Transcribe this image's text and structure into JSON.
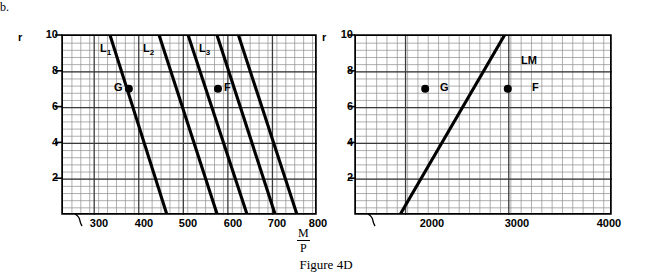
{
  "figure": {
    "panel_letter": "b.",
    "caption": "Figure 4D"
  },
  "chart_data": [
    {
      "id": "left",
      "type": "line",
      "title": "",
      "xlabel": "M/P",
      "ylabel": "r",
      "xlim": [
        230,
        800
      ],
      "ylim": [
        0,
        10
      ],
      "xticks": [
        300,
        400,
        500,
        600,
        700,
        800
      ],
      "yticks": [
        2,
        4,
        6,
        8,
        10
      ],
      "grid": true,
      "grid_minor_step_x": 20,
      "grid_minor_step_y": 0.4,
      "axis_break_x": true,
      "series": [
        {
          "name": "L1",
          "label": "L₁",
          "label_text": "L",
          "label_sub": "1",
          "points": [
            [
              330,
              10.6
            ],
            [
              465,
              0
            ]
          ]
        },
        {
          "name": "L2",
          "label": "L₂",
          "label_text": "L",
          "label_sub": "2",
          "points": [
            [
              440,
              10.6
            ],
            [
              578,
              0
            ]
          ]
        },
        {
          "name": "L3",
          "label": "L₃",
          "label_text": "L",
          "label_sub": "3",
          "points": [
            [
              505,
              10.6
            ],
            [
              645,
              0
            ]
          ]
        }
      ],
      "extra_lines": [
        {
          "name": "L2-right",
          "points": [
            [
              570,
              10.6
            ],
            [
              708,
              0
            ]
          ]
        },
        {
          "name": "L3-right",
          "points": [
            [
              618,
              10.6
            ],
            [
              757,
              0
            ]
          ]
        }
      ],
      "points_marked": [
        {
          "name": "G",
          "label": "G",
          "x": 380,
          "y": 7,
          "label_side": "left"
        },
        {
          "name": "F",
          "label": "F",
          "x": 580,
          "y": 7,
          "label_side": "right"
        }
      ]
    },
    {
      "id": "right",
      "type": "line",
      "title": "",
      "xlabel": "",
      "ylabel": "r",
      "xlim": [
        1520,
        4000
      ],
      "ylim": [
        0,
        10
      ],
      "xticks": [
        2000,
        3000,
        4000
      ],
      "yticks": [
        2,
        4,
        6,
        8,
        10
      ],
      "grid": true,
      "grid_minor_step_x": 100,
      "grid_minor_step_y": 0.4,
      "axis_break_x": true,
      "series": [
        {
          "name": "LM",
          "label": "LM",
          "label_text": "LM",
          "label_sub": "",
          "points": [
            [
              1960,
              0
            ],
            [
              3030,
              10.6
            ]
          ]
        }
      ],
      "points_marked": [
        {
          "name": "G",
          "label": "G",
          "x": 2200,
          "y": 7,
          "label_side": "left"
        },
        {
          "name": "F",
          "label": "F",
          "x": 3000,
          "y": 7,
          "label_side": "right"
        }
      ]
    }
  ],
  "labels": {
    "r_left": "r",
    "r_right": "r",
    "mp_numerator": "M",
    "mp_denominator": "P",
    "y_ticks": [
      "10",
      "8",
      "6",
      "4",
      "2"
    ],
    "x_ticks_left": [
      "300",
      "400",
      "500",
      "600",
      "700",
      "800"
    ],
    "x_ticks_right": [
      "2000",
      "3000",
      "4000"
    ],
    "curve_left_1": "L",
    "curve_left_1_sub": "1",
    "curve_left_2": "L",
    "curve_left_2_sub": "2",
    "curve_left_3": "L",
    "curve_left_3_sub": "3",
    "curve_right": "LM",
    "point_g_left": "G",
    "point_f_left": "F",
    "point_g_right": "G",
    "point_f_right": "F"
  },
  "colors": {
    "ink": "#000000",
    "grid_minor": "#8c8c8c",
    "grid_major": "#3a3a3a",
    "background": "#ffffff"
  }
}
